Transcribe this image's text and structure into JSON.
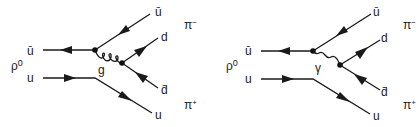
{
  "diagrams": [
    {
      "id": "gluon",
      "meson_label": "ρ0",
      "meson_sup": "0",
      "meson_base": "ρ",
      "in_top_label": "ū",
      "in_bottom_label": "u",
      "boson_label": "g",
      "out_labels": {
        "ubar": "ū",
        "d": "d",
        "dbar": "d̄",
        "u": "u"
      },
      "pi_minus": {
        "base": "π",
        "sup": "−"
      },
      "pi_plus": {
        "base": "π",
        "sup": "+"
      }
    },
    {
      "id": "photon",
      "meson_label": "ρ0",
      "meson_sup": "0",
      "meson_base": "ρ",
      "in_top_label": "ū",
      "in_bottom_label": "u",
      "boson_label": "γ",
      "out_labels": {
        "ubar": "ū",
        "d": "d",
        "dbar": "d̄",
        "u": "u"
      },
      "pi_minus": {
        "base": "π",
        "sup": "−"
      },
      "pi_plus": {
        "base": "π",
        "sup": "+"
      }
    }
  ]
}
